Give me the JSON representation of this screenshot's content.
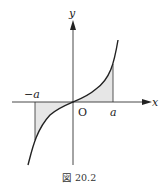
{
  "figure": {
    "caption": "図 20.2",
    "labels": {
      "x_axis": "x",
      "y_axis": "y",
      "origin": "O",
      "neg_a": "−a",
      "pos_a": "a"
    },
    "colors": {
      "line": "#222222",
      "shade": "#e6e6e6"
    }
  }
}
